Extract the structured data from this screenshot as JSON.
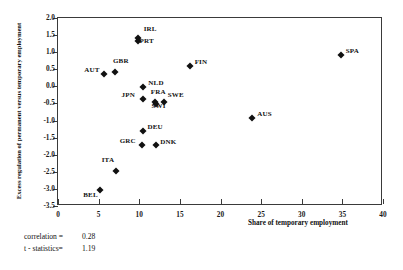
{
  "chart_data": {
    "type": "scatter",
    "title": "",
    "xlabel": "Share of temporary employment",
    "ylabel": "Excess regulation of permanent versus temporary employment",
    "xlim": [
      0,
      40
    ],
    "ylim": [
      -3.5,
      2.0
    ],
    "xticks": [
      "0",
      "5",
      "10",
      "15",
      "20",
      "25",
      "30",
      "35",
      "40"
    ],
    "xtick_values": [
      0,
      5,
      10,
      15,
      20,
      25,
      30,
      35,
      40
    ],
    "yticks": [
      "2.0",
      "1.5",
      "1.0",
      "0.5",
      "0.0",
      "-0.5",
      "-1.0",
      "-1.5",
      "-2.0",
      "-2.5",
      "-3.0",
      "-3.5"
    ],
    "ytick_values": [
      2.0,
      1.5,
      1.0,
      0.5,
      0.0,
      -0.5,
      -1.0,
      -1.5,
      -2.0,
      -2.5,
      -3.0,
      -3.5
    ],
    "grid": false,
    "legend": false,
    "marker": "diamond",
    "marker_color": "#111111",
    "points": [
      {
        "label": "BEL",
        "x": 5.2,
        "y": -3.02,
        "lx": -17,
        "ly": 5
      },
      {
        "label": "AUT",
        "x": 5.7,
        "y": 0.35,
        "lx": -20,
        "ly": -4
      },
      {
        "label": "GBR",
        "x": 7.0,
        "y": 0.42,
        "lx": -2,
        "ly": -11
      },
      {
        "label": "ITA",
        "x": 7.1,
        "y": -2.48,
        "lx": -14,
        "ly": -11
      },
      {
        "label": "IRL",
        "x": 9.8,
        "y": 1.42,
        "lx": 6,
        "ly": -9
      },
      {
        "label": "PRT",
        "x": 9.9,
        "y": 1.34,
        "lx": 1,
        "ly": 0
      },
      {
        "label": "GRC",
        "x": 10.3,
        "y": -1.73,
        "lx": -22,
        "ly": -4
      },
      {
        "label": "NLD",
        "x": 10.5,
        "y": -0.02,
        "lx": 5,
        "ly": -4
      },
      {
        "label": "JPN",
        "x": 10.4,
        "y": -0.37,
        "lx": -21,
        "ly": -4
      },
      {
        "label": "DEU",
        "x": 10.4,
        "y": -1.32,
        "lx": 5,
        "ly": -4
      },
      {
        "label": "FRA",
        "x": 11.9,
        "y": -0.47,
        "lx": -4,
        "ly": -10
      },
      {
        "label": "SWI",
        "x": 12.0,
        "y": -0.52,
        "lx": -4,
        "ly": 2
      },
      {
        "label": "DNK",
        "x": 12.1,
        "y": -1.73,
        "lx": 4,
        "ly": -3
      },
      {
        "label": "SWE",
        "x": 13.0,
        "y": -0.46,
        "lx": 4,
        "ly": -7
      },
      {
        "label": "FIN",
        "x": 16.2,
        "y": 0.59,
        "lx": 5,
        "ly": -4
      },
      {
        "label": "AUS",
        "x": 23.9,
        "y": -0.92,
        "lx": 5,
        "ly": -4
      },
      {
        "label": "SPA",
        "x": 34.8,
        "y": 0.92,
        "lx": 5,
        "ly": -4
      }
    ],
    "annotations": {
      "correlation_label": "correlation =",
      "correlation_value": "0.28",
      "tstat_label": "t - statistics=",
      "tstat_value": "1.19"
    }
  }
}
